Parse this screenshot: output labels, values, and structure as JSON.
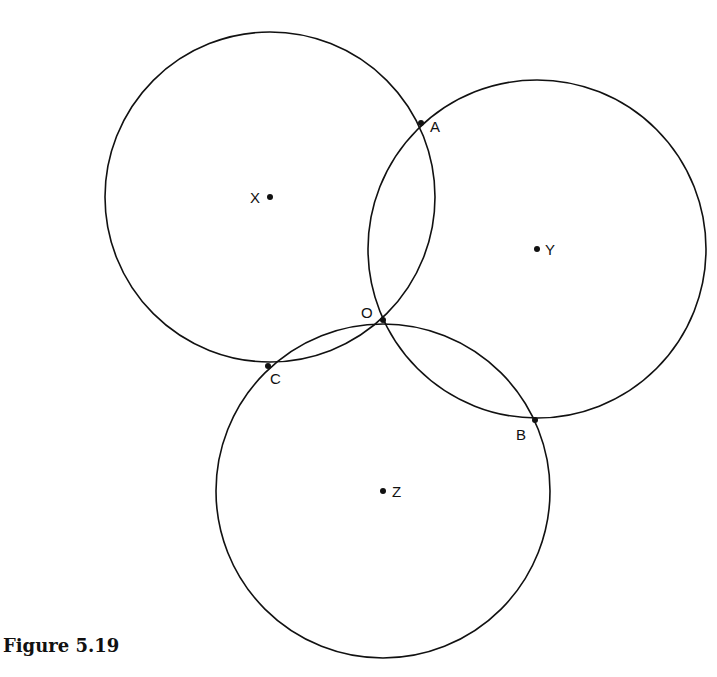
{
  "figure": {
    "caption": "Figure 5.19",
    "circles": [
      {
        "center": "X",
        "cx": 270,
        "cy": 197,
        "r": 165
      },
      {
        "center": "Y",
        "cx": 537,
        "cy": 249,
        "r": 169
      },
      {
        "center": "Z",
        "cx": 383,
        "cy": 491,
        "r": 167
      }
    ],
    "points": [
      {
        "label": "X",
        "x": 270,
        "y": 197
      },
      {
        "label": "Y",
        "x": 537,
        "y": 249
      },
      {
        "label": "Z",
        "x": 383,
        "y": 491
      },
      {
        "label": "A",
        "x": 421,
        "y": 123
      },
      {
        "label": "O",
        "x": 383,
        "y": 320
      },
      {
        "label": "C",
        "x": 268,
        "y": 366
      },
      {
        "label": "B",
        "x": 535,
        "y": 420
      }
    ],
    "labels": {
      "X": "X",
      "Y": "Y",
      "Z": "Z",
      "A": "A",
      "O": "O",
      "C": "C",
      "B": "B"
    },
    "stroke_color": "#111111"
  }
}
